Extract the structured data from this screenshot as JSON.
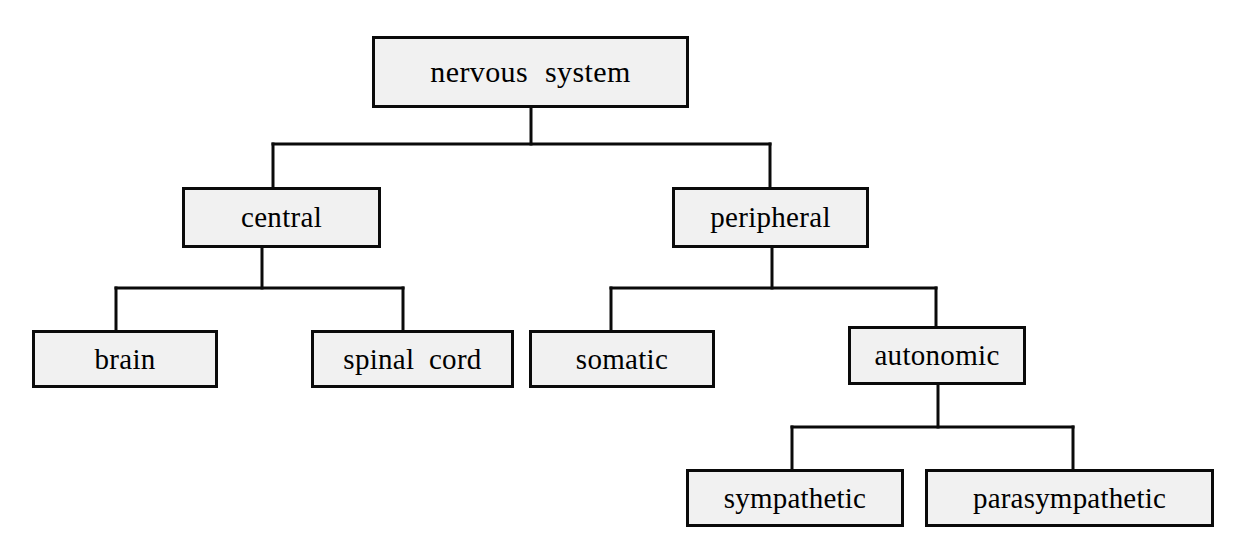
{
  "diagram": {
    "type": "hierarchy-tree",
    "title": "nervous system",
    "orientation": "top-down",
    "colors": {
      "page_background": "#ffffff",
      "node_fill": "#f1f1f1",
      "node_border": "#0a0a0a",
      "connector": "#0a0a0a",
      "text": "#000000"
    },
    "nodes": [
      {
        "id": "nervous-system",
        "label": "nervous system",
        "level": 0,
        "parent": null,
        "box": {
          "x": 372,
          "y": 36,
          "w": 317,
          "h": 72
        }
      },
      {
        "id": "central",
        "label": "central",
        "level": 1,
        "parent": "nervous-system",
        "box": {
          "x": 182,
          "y": 187,
          "w": 199,
          "h": 61
        }
      },
      {
        "id": "peripheral",
        "label": "peripheral",
        "level": 1,
        "parent": "nervous-system",
        "box": {
          "x": 672,
          "y": 187,
          "w": 197,
          "h": 61
        }
      },
      {
        "id": "brain",
        "label": "brain",
        "level": 2,
        "parent": "central",
        "box": {
          "x": 32,
          "y": 330,
          "w": 186,
          "h": 58
        }
      },
      {
        "id": "spinal-cord",
        "label": "spinal cord",
        "level": 2,
        "parent": "central",
        "box": {
          "x": 311,
          "y": 330,
          "w": 203,
          "h": 58
        }
      },
      {
        "id": "somatic",
        "label": "somatic",
        "level": 2,
        "parent": "peripheral",
        "box": {
          "x": 529,
          "y": 330,
          "w": 186,
          "h": 58
        }
      },
      {
        "id": "autonomic",
        "label": "autonomic",
        "level": 2,
        "parent": "peripheral",
        "box": {
          "x": 848,
          "y": 326,
          "w": 178,
          "h": 59
        }
      },
      {
        "id": "sympathetic",
        "label": "sympathetic",
        "level": 3,
        "parent": "autonomic",
        "box": {
          "x": 686,
          "y": 469,
          "w": 218,
          "h": 58
        }
      },
      {
        "id": "parasympathetic",
        "label": "parasympathetic",
        "level": 3,
        "parent": "autonomic",
        "box": {
          "x": 925,
          "y": 469,
          "w": 289,
          "h": 58
        }
      }
    ],
    "edges": [
      {
        "from": "nervous-system",
        "to": "central"
      },
      {
        "from": "nervous-system",
        "to": "peripheral"
      },
      {
        "from": "central",
        "to": "brain"
      },
      {
        "from": "central",
        "to": "spinal-cord"
      },
      {
        "from": "peripheral",
        "to": "somatic"
      },
      {
        "from": "peripheral",
        "to": "autonomic"
      },
      {
        "from": "autonomic",
        "to": "sympathetic"
      },
      {
        "from": "autonomic",
        "to": "parasympathetic"
      }
    ],
    "connector_paths": [
      {
        "name": "root-stem",
        "d": "M 531 108 L 531 144"
      },
      {
        "name": "root-crossbar",
        "d": "M 273 144 L 770 144"
      },
      {
        "name": "stem-central",
        "d": "M 273 144 L 273 187"
      },
      {
        "name": "stem-peripheral",
        "d": "M 770 144 L 770 187"
      },
      {
        "name": "central-stem",
        "d": "M 262 248 L 262 288"
      },
      {
        "name": "central-crossbar",
        "d": "M 116 288 L 403 288"
      },
      {
        "name": "stem-brain",
        "d": "M 116 288 L 116 330"
      },
      {
        "name": "stem-spinal-cord",
        "d": "M 403 288 L 403 330"
      },
      {
        "name": "peripheral-stem",
        "d": "M 772 248 L 772 288"
      },
      {
        "name": "peripheral-crossbar",
        "d": "M 611 288 L 936 288"
      },
      {
        "name": "stem-somatic",
        "d": "M 611 288 L 611 330"
      },
      {
        "name": "stem-autonomic",
        "d": "M 936 288 L 936 326"
      },
      {
        "name": "autonomic-stem",
        "d": "M 938 385 L 938 427"
      },
      {
        "name": "autonomic-crossbar",
        "d": "M 792 427 L 1073 427"
      },
      {
        "name": "stem-sympathetic",
        "d": "M 792 427 L 792 469"
      },
      {
        "name": "stem-parasympathetic",
        "d": "M 1073 427 L 1073 469"
      }
    ]
  }
}
